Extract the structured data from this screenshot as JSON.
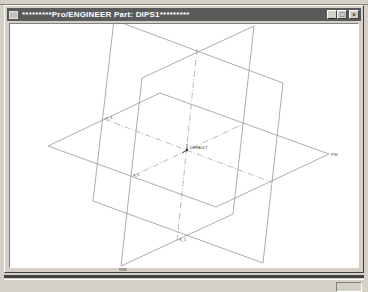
{
  "window": {
    "title": "*********Pro/ENGINEER Part: DIPS1*********",
    "buttons": {
      "minimize": "_",
      "maximize": "□",
      "close": "×"
    }
  },
  "model": {
    "datum_planes": [
      {
        "name": "FRNT",
        "label_pos": [
          110,
          15
        ]
      },
      {
        "name": "RIGHT",
        "label": "RIW",
        "label_pos": [
          118,
          264
        ]
      },
      {
        "name": "TOP",
        "label": "PW",
        "label_pos": [
          330,
          150
        ]
      }
    ],
    "csys_label": "DEFAULT",
    "axis_labels": [
      "X",
      "Y",
      "Z",
      "X_1",
      "Y_1",
      "Z_1"
    ],
    "point_labels": [
      "s_1",
      "z_1"
    ]
  },
  "colors": {
    "titlebar": "#5a5a5a",
    "datum_line": "#8a8a8a",
    "background": "#ffffff",
    "chrome": "#d4d0c8"
  }
}
